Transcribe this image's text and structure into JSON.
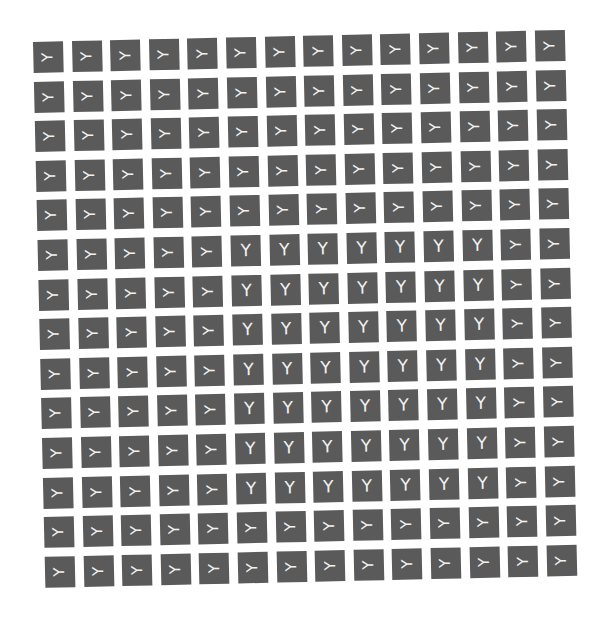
{
  "grid": {
    "rows": 14,
    "cols": 14,
    "tile_color": "#5a5a5a",
    "glyph_color": "#f2f2f2",
    "glyph": "Y",
    "default_orientation": "sideways",
    "upright_block": {
      "row_start": 5,
      "row_end": 11,
      "col_start": 5,
      "col_end": 11
    }
  }
}
